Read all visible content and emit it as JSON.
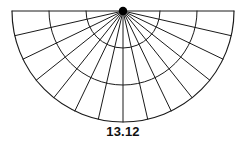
{
  "figure": {
    "kind": "semicircular-polar-grid",
    "caption": "13.12",
    "stroke_color": "#1a1a1a",
    "apex_color": "#000000",
    "background_color": "#ffffff"
  },
  "chart_data": {
    "type": "pie",
    "title": "13.12",
    "xlabel": "",
    "ylabel": "",
    "orientation": "semicircle-downward",
    "grid": true,
    "legend": false,
    "center": [
      123,
      11
    ],
    "radius": 111,
    "angle_range_deg": [
      0,
      180
    ],
    "sector_count": 14,
    "ring_count": 3,
    "radial_ring_radii": [
      37,
      74,
      111
    ],
    "sector_boundary_angles_deg": [
      0,
      12.857,
      25.714,
      38.571,
      51.429,
      64.286,
      77.143,
      90,
      102.857,
      115.714,
      128.571,
      141.429,
      154.286,
      167.143,
      180
    ],
    "categories": [
      "s1",
      "s2",
      "s3",
      "s4",
      "s5",
      "s6",
      "s7",
      "s8",
      "s9",
      "s10",
      "s11",
      "s12",
      "s13",
      "s14"
    ],
    "values": [
      1,
      1,
      1,
      1,
      1,
      1,
      1,
      1,
      1,
      1,
      1,
      1,
      1,
      1
    ]
  }
}
